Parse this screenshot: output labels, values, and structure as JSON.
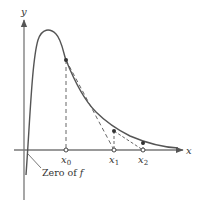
{
  "figure": {
    "axis_labels": {
      "x": "x",
      "y": "y"
    },
    "points": [
      {
        "label_base": "x",
        "label_sub": "0"
      },
      {
        "label_base": "x",
        "label_sub": "1"
      },
      {
        "label_base": "x",
        "label_sub": "2"
      }
    ],
    "annotation": {
      "text_main": "Zero of ",
      "text_italic": "f"
    },
    "colors": {
      "curve": "#4a4a4a",
      "axis": "#666666",
      "dashed": "#555555",
      "point": "#333333"
    }
  }
}
